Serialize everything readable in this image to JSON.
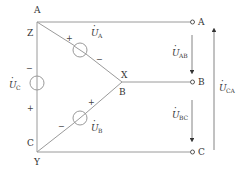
{
  "diagram": {
    "nodes": {
      "top_left": {
        "letters": [
          "A",
          "Z"
        ]
      },
      "middle": {
        "letters": [
          "X",
          "B"
        ]
      },
      "bottom_left": {
        "letters": [
          "C",
          "Y"
        ]
      }
    },
    "terminals": [
      {
        "name": "A",
        "label": "A"
      },
      {
        "name": "B",
        "label": "B"
      },
      {
        "name": "C",
        "label": "C"
      }
    ],
    "sources": [
      {
        "name": "U_A",
        "symbol": "U",
        "dot": "·",
        "subscript": "A",
        "plus": "+",
        "minus": "−"
      },
      {
        "name": "U_B",
        "symbol": "U",
        "dot": "·",
        "subscript": "B",
        "plus": "+",
        "minus": "−"
      },
      {
        "name": "U_C",
        "symbol": "U",
        "dot": "·",
        "subscript": "C",
        "plus": "+",
        "minus": "−"
      }
    ],
    "voltage_arrows": [
      {
        "name": "U_AB",
        "symbol": "U",
        "subscript": "AB",
        "direction": "down"
      },
      {
        "name": "U_BC",
        "symbol": "U",
        "subscript": "BC",
        "direction": "down"
      },
      {
        "name": "U_CA",
        "symbol": "U",
        "subscript": "CA",
        "direction": "up"
      }
    ],
    "colors": {
      "line": "#9a9a9a",
      "text": "#333333"
    }
  }
}
